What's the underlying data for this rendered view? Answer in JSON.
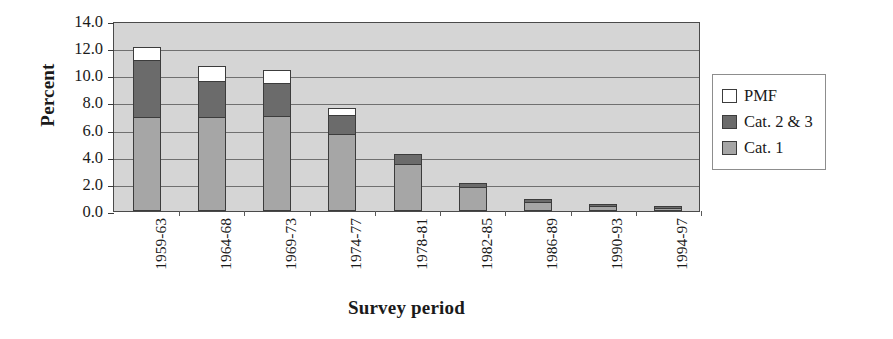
{
  "chart_data": {
    "type": "bar",
    "subtype": "stacked-bar",
    "title": "",
    "xlabel": "Survey period",
    "ylabel": "Percent",
    "categories": [
      "1959-63",
      "1964-68",
      "1969-73",
      "1974-77",
      "1978-81",
      "1982-85",
      "1986-89",
      "1990-93",
      "1994-97"
    ],
    "series": [
      {
        "name": "Cat. 1",
        "color": "#a6a6a6",
        "values": [
          6.9,
          6.9,
          7.0,
          5.7,
          3.5,
          1.8,
          0.7,
          0.4,
          0.25
        ]
      },
      {
        "name": "Cat. 2 & 3",
        "color": "#6b6b6b",
        "values": [
          4.2,
          2.7,
          2.4,
          1.4,
          0.7,
          0.25,
          0.15,
          0.1,
          0.1
        ]
      },
      {
        "name": "PMF",
        "color": "#ffffff",
        "values": [
          1.0,
          1.1,
          1.0,
          0.5,
          0.0,
          0.0,
          0.0,
          0.0,
          0.0
        ]
      }
    ],
    "totals": [
      12.1,
      10.7,
      10.4,
      7.6,
      4.2,
      2.05,
      0.85,
      0.5,
      0.35
    ],
    "ylim": [
      0.0,
      14.0
    ],
    "ytick_step": 2.0,
    "ytick_labels": [
      "0.0",
      "2.0",
      "4.0",
      "6.0",
      "8.0",
      "10.0",
      "12.0",
      "14.0"
    ],
    "ytick_values": [
      0,
      2,
      4,
      6,
      8,
      10,
      12,
      14
    ],
    "grid": true,
    "grid_axis": "y",
    "legend_position": "right",
    "legend_order": [
      "PMF",
      "Cat. 2 & 3",
      "Cat. 1"
    ],
    "plot_background": "#d5d5d5",
    "figure_background": "#ffffff",
    "axis_color": "#4a4a4a",
    "gridline_color": "#707070"
  },
  "legend": {
    "items": [
      {
        "label": "PMF",
        "color": "#ffffff"
      },
      {
        "label": "Cat. 2 & 3",
        "color": "#6b6b6b"
      },
      {
        "label": "Cat. 1",
        "color": "#a6a6a6"
      }
    ]
  }
}
